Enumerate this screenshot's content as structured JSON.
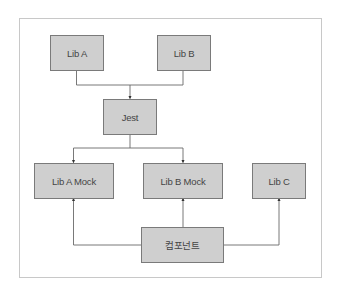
{
  "diagram": {
    "type": "dependency-flow",
    "nodes": {
      "lib_a": "Lib A",
      "lib_b": "Lib B",
      "jest": "Jest",
      "lib_a_mock": "Lib A Mock",
      "lib_b_mock": "Lib B Mock",
      "lib_c": "Lib C",
      "component": "컴포넌트"
    },
    "edges": [
      {
        "from": "Lib A",
        "to": "Jest"
      },
      {
        "from": "Lib B",
        "to": "Jest"
      },
      {
        "from": "Jest",
        "to": "Lib A Mock"
      },
      {
        "from": "Jest",
        "to": "Lib B Mock"
      },
      {
        "from": "컴포넌트",
        "to": "Lib A Mock"
      },
      {
        "from": "컴포넌트",
        "to": "Lib B Mock"
      },
      {
        "from": "컴포넌트",
        "to": "Lib C"
      }
    ],
    "colors": {
      "node_fill": "#cfcfcf",
      "node_border": "#7a7a7a",
      "line": "#6a6a6a",
      "frame_border": "#c8c8c8"
    }
  }
}
